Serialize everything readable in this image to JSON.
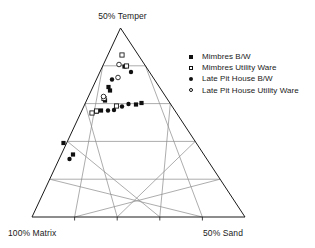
{
  "chart_data": {
    "type": "scatter",
    "title": "",
    "plot_style": "ternary",
    "apex_label": "50% Temper",
    "left_label": "100% Matrix",
    "right_label": "50% Sand",
    "axes": {
      "top": {
        "name": "Temper",
        "max_label": "50% Temper"
      },
      "left": {
        "name": "Matrix",
        "max_label": "100% Matrix"
      },
      "right": {
        "name": "Sand",
        "max_label": "50% Sand"
      }
    },
    "grid": {
      "divisions": 5,
      "show_parallel_to_base": true,
      "show_parallel_to_left": true,
      "show_parallel_to_right": true,
      "tick_count_base": 4
    },
    "geometry": {
      "apex_x": 120.5,
      "apex_y": 28,
      "base_left_x": 32,
      "base_right_x": 245,
      "base_y": 217
    },
    "legend": {
      "position": "top-right",
      "entries": [
        {
          "label": "Mimbres B/W",
          "marker": "filled-square"
        },
        {
          "label": "Mimbres Utility Ware",
          "marker": "open-square"
        },
        {
          "label": "Late Pit House B/W",
          "marker": "filled-circle"
        },
        {
          "label": "Late Pit House Utility Ware",
          "marker": "open-circle"
        }
      ]
    },
    "series": [
      {
        "name": "Mimbres B/W",
        "marker": "filled-square",
        "points": [
          {
            "x": 124.5,
            "y": 66.5
          },
          {
            "x": 108.5,
            "y": 87.0
          },
          {
            "x": 110.0,
            "y": 90.5
          },
          {
            "x": 105.0,
            "y": 100.5
          },
          {
            "x": 136.0,
            "y": 104.5
          },
          {
            "x": 141.5,
            "y": 103.0
          },
          {
            "x": 101.0,
            "y": 110.5
          },
          {
            "x": 96.5,
            "y": 111.5
          },
          {
            "x": 63.5,
            "y": 143.0
          },
          {
            "x": 73.0,
            "y": 154.5
          }
        ]
      },
      {
        "name": "Mimbres Utility Ware",
        "marker": "open-square",
        "points": [
          {
            "x": 122.0,
            "y": 55.0
          },
          {
            "x": 126.5,
            "y": 66.0
          },
          {
            "x": 104.0,
            "y": 98.5
          },
          {
            "x": 116.5,
            "y": 106.0
          },
          {
            "x": 96.5,
            "y": 111.0
          },
          {
            "x": 92.0,
            "y": 113.0
          }
        ]
      },
      {
        "name": "Late Pit House B/W",
        "marker": "filled-circle",
        "points": [
          {
            "x": 131.0,
            "y": 72.0
          },
          {
            "x": 112.0,
            "y": 79.5
          },
          {
            "x": 122.0,
            "y": 106.5
          },
          {
            "x": 128.5,
            "y": 104.0
          },
          {
            "x": 114.0,
            "y": 110.0
          },
          {
            "x": 108.0,
            "y": 110.5
          },
          {
            "x": 69.5,
            "y": 159.0
          }
        ]
      },
      {
        "name": "Late Pit House Utility Ware",
        "marker": "open-circle",
        "points": [
          {
            "x": 119.0,
            "y": 64.5
          },
          {
            "x": 118.0,
            "y": 77.5
          },
          {
            "x": 103.5,
            "y": 96.5
          }
        ]
      }
    ]
  },
  "colors": {
    "outline": "#1a1a1a",
    "grid": "#8a8a8a",
    "marker": "#101010",
    "background": "#ffffff"
  }
}
